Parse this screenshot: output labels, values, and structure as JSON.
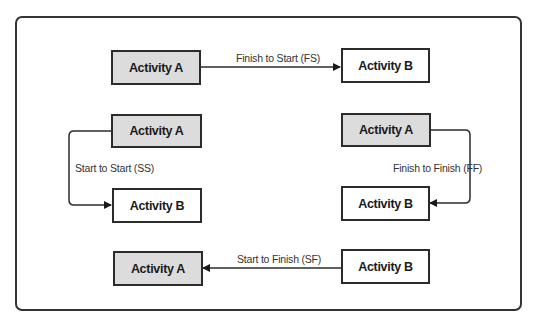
{
  "diagram": {
    "colors": {
      "predecessor_fill": "#dcdcdc",
      "successor_fill": "#ffffff",
      "stroke": "#2b2b2b"
    },
    "relationships": [
      {
        "type": "FS",
        "label": "Finish to Start (FS)",
        "from": {
          "label": "Activity A",
          "fill": "grey"
        },
        "to": {
          "label": "Activity B",
          "fill": "white"
        },
        "direction": "A end -> B start"
      },
      {
        "type": "SS",
        "label": "Start to Start (SS)",
        "from": {
          "label": "Activity A",
          "fill": "grey"
        },
        "to": {
          "label": "Activity B",
          "fill": "white"
        },
        "direction": "A start -> B start"
      },
      {
        "type": "FF",
        "label": "Finish to Finish (FF)",
        "from": {
          "label": "Activity A",
          "fill": "grey"
        },
        "to": {
          "label": "Activity B",
          "fill": "white"
        },
        "direction": "A finish -> B finish"
      },
      {
        "type": "SF",
        "label": "Start to Finish (SF)",
        "from": {
          "label": "Activity B",
          "fill": "white"
        },
        "to": {
          "label": "Activity A",
          "fill": "grey"
        },
        "direction": "B start -> A finish"
      }
    ]
  }
}
